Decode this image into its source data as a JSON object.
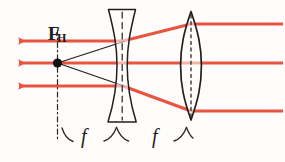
{
  "figure": {
    "kind": "optics-ray-diagram",
    "width": 285,
    "height": 162,
    "background_color": "#fefdfb"
  },
  "colors": {
    "ray_red": "#e8543f",
    "ray_red_light": "#f08b78",
    "ink_black": "#1f1d1c",
    "pencil_gray": "#3a3734"
  },
  "labels": {
    "focal_point": "F",
    "focal_point_subscript": "H",
    "focal_length_left": "f",
    "focal_length_right": "f"
  },
  "optical_axis": {
    "y": 63,
    "x_start": 12,
    "x_end": 281
  },
  "focal_point": {
    "x": 57,
    "y": 63,
    "radius": 4.6
  },
  "vertical_dash_dot_line": {
    "x": 57,
    "y_top": 30,
    "y_bottom": 140
  },
  "lenses": [
    {
      "name": "diverging-lens",
      "type": "biconcave",
      "center_x": 122,
      "top_y": 9,
      "bottom_y": 122,
      "half_width_outer": 13,
      "waist_half_width": 5,
      "axis_dashed": true
    },
    {
      "name": "converging-lens",
      "type": "biconvex",
      "center_x": 191,
      "top_y": 11,
      "bottom_y": 120,
      "half_width": 10,
      "axis_dashed": true
    }
  ],
  "rays": [
    {
      "name": "upper-ray",
      "color": "#e8543f",
      "segments": [
        {
          "x1": 283,
          "y1": 24,
          "x2": 191,
          "y2": 24
        },
        {
          "x1": 191,
          "y1": 24,
          "x2": 122,
          "y2": 41
        },
        {
          "x1": 122,
          "y1": 41,
          "x2": 18,
          "y2": 41
        }
      ],
      "arrow_at": {
        "x": 14,
        "y": 41,
        "direction": "left"
      }
    },
    {
      "name": "axial-ray",
      "color": "#e8543f",
      "segments": [
        {
          "x1": 283,
          "y1": 63,
          "x2": 191,
          "y2": 63
        },
        {
          "x1": 191,
          "y1": 63,
          "x2": 122,
          "y2": 63
        },
        {
          "x1": 122,
          "y1": 63,
          "x2": 18,
          "y2": 63
        }
      ],
      "arrow_at": {
        "x": 14,
        "y": 63,
        "direction": "left"
      }
    },
    {
      "name": "lower-ray",
      "color": "#e8543f",
      "segments": [
        {
          "x1": 283,
          "y1": 111,
          "x2": 191,
          "y2": 111
        },
        {
          "x1": 191,
          "y1": 111,
          "x2": 122,
          "y2": 86
        },
        {
          "x1": 122,
          "y1": 86,
          "x2": 18,
          "y2": 86
        }
      ],
      "arrow_at": {
        "x": 14,
        "y": 86,
        "direction": "left"
      }
    }
  ],
  "construction_lines": [
    {
      "name": "upper-construction",
      "x1": 57,
      "y1": 63,
      "x2": 124,
      "y2": 41
    },
    {
      "name": "lower-construction",
      "x1": 57,
      "y1": 63,
      "x2": 124,
      "y2": 86
    }
  ],
  "braces": [
    {
      "name": "left-focal-brace",
      "x_start": 61,
      "x_end": 117,
      "y": 134
    },
    {
      "name": "right-focal-brace",
      "x_start": 128,
      "x_end": 188,
      "y": 134
    }
  ]
}
